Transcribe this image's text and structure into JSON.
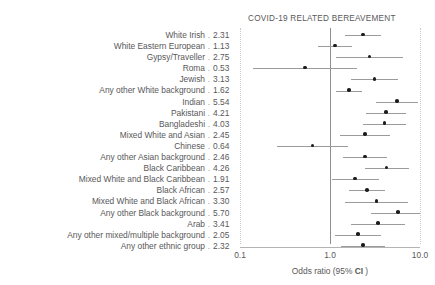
{
  "chart_data": {
    "type": "scatter",
    "subtype": "forest-plot",
    "title": "COVID-19 RELATED BEREAVEMENT",
    "xlabel": "Odds ratio (95% CI )",
    "ylabel": "",
    "xscale": "log",
    "xlim": [
      0.1,
      10.0
    ],
    "xticks": [
      0.1,
      1.0,
      10.0
    ],
    "xtick_labels": [
      "0.1",
      "1.0",
      "10.0"
    ],
    "reference_line": 1.0,
    "grid": "vertical dotted at 0.1 and 10.0, solid at 1.0",
    "legend": "none",
    "value_column_header": "",
    "categories": [
      "White Irish",
      "White Eastern European",
      "Gypsy/Traveller",
      "Roma",
      "Jewish",
      "Any other White background",
      "Indian",
      "Pakistani",
      "Bangladeshi",
      "Mixed White and Asian",
      "Chinese",
      "Any other Asian background",
      "Black Caribbean",
      "Mixed White and Black Caribbean",
      "Black African",
      "Mixed White and Black African",
      "Any other Black background",
      "Arab",
      "Any other mixed/multiple background",
      "Any other ethnic group"
    ],
    "values": [
      2.31,
      1.13,
      2.75,
      0.53,
      3.13,
      1.62,
      5.54,
      4.21,
      4.03,
      2.45,
      0.64,
      2.46,
      4.26,
      1.91,
      2.57,
      3.3,
      5.7,
      3.41,
      2.05,
      2.32
    ],
    "value_labels": [
      "2.31",
      "1.13",
      "2.75",
      "0.53",
      "3.13",
      "1.62",
      "5.54",
      "4.21",
      "4.03",
      "2.45",
      "0.64",
      "2.46",
      "4.26",
      "1.91",
      "2.57",
      "3.30",
      "5.70",
      "3.41",
      "2.05",
      "2.32"
    ],
    "ci_low": [
      1.45,
      0.73,
      1.17,
      0.14,
      1.72,
      1.17,
      3.22,
      2.53,
      2.3,
      1.3,
      0.26,
      1.4,
      2.42,
      1.04,
      1.61,
      1.48,
      2.83,
      1.71,
      1.15,
      1.32
    ],
    "ci_high": [
      3.67,
      1.76,
      6.46,
      2.0,
      5.69,
      2.25,
      9.53,
      7.01,
      7.06,
      4.61,
      1.58,
      4.32,
      7.5,
      3.51,
      4.1,
      7.36,
      11.5,
      6.8,
      3.65,
      4.07
    ],
    "separator": "."
  },
  "axis": {
    "tick_0": "0.1",
    "tick_1": "1.0",
    "tick_2": "10.0",
    "title_main": "Odds ratio (95% ",
    "title_bold": "CI",
    "title_tail": " )"
  },
  "colors": {
    "text": "#58585a",
    "point": "#1c1c1e",
    "ci": "#9b9b9d",
    "reference_line": "#8e8e90",
    "gridline": "#c9c9cb",
    "background": "#ffffff"
  }
}
